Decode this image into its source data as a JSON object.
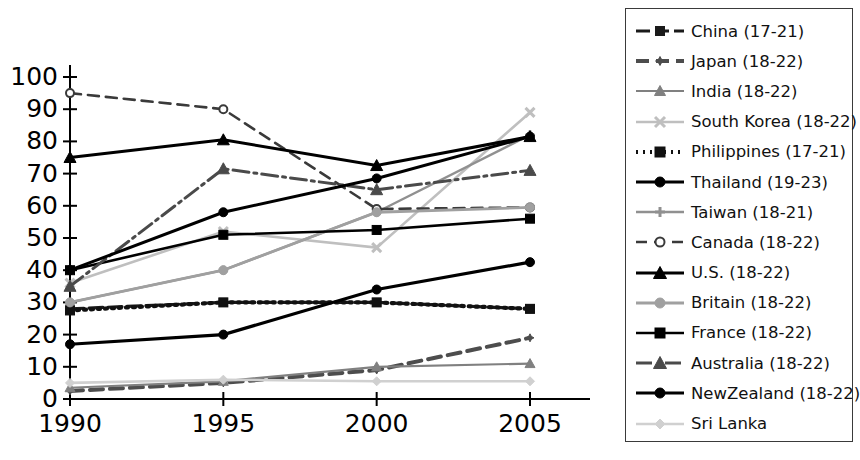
{
  "chart_data": {
    "type": "line",
    "title": "",
    "xlabel": "",
    "ylabel": "",
    "x": [
      1990,
      1995,
      2000,
      2005
    ],
    "categories": [
      "1990",
      "1995",
      "2000",
      "2005"
    ],
    "xtick_labels": [
      "1990",
      "1995",
      "2000",
      "2005"
    ],
    "ytick_labels": [
      "0",
      "10",
      "20",
      "30",
      "40",
      "50",
      "60",
      "70",
      "80",
      "90",
      "100"
    ],
    "ylim": [
      0,
      100
    ],
    "xlim": [
      1990,
      2005
    ],
    "grid": false,
    "legend_position": "right-outside",
    "series": [
      {
        "name": "China (17-21)",
        "label": "China (17-21)",
        "values": [
          28,
          30,
          30,
          28
        ],
        "color": "#1a1a1a",
        "dash": "14,5",
        "width": 3.2,
        "marker": "square",
        "marker_size": 8
      },
      {
        "name": "Japan (18-22)",
        "label": "Japan (18-22)",
        "values": [
          2.5,
          5,
          9,
          19
        ],
        "color": "#4d4d4d",
        "dash": "13,7",
        "width": 4.0,
        "marker": "star",
        "marker_size": 8
      },
      {
        "name": "India (18-22)",
        "label": "India (18-22)",
        "values": [
          3.5,
          5.5,
          10,
          11
        ],
        "color": "#808080",
        "dash": "none",
        "width": 2.2,
        "marker": "triangle",
        "marker_size": 8
      },
      {
        "name": "South Korea (18-22)",
        "label": "South Korea (18-22)",
        "values": [
          36,
          52,
          47,
          89
        ],
        "color": "#bfbfbf",
        "dash": "none",
        "width": 2.6,
        "marker": "cross",
        "marker_size": 9
      },
      {
        "name": "Philippines (17-21)",
        "label": "Philippines (17-21)",
        "values": [
          27.5,
          30,
          30,
          28
        ],
        "color": "#111111",
        "dash": "2,5",
        "width": 4.2,
        "marker": "square",
        "marker_size": 9
      },
      {
        "name": "Thailand (19-23)",
        "label": "Thailand (19-23)",
        "values": [
          17,
          20,
          34,
          42.5
        ],
        "color": "#000000",
        "dash": "none",
        "width": 3.2,
        "marker": "circle",
        "marker_size": 9
      },
      {
        "name": "Taiwan (18-21)",
        "label": "Taiwan (18-21)",
        "values": [
          30,
          40,
          58,
          82
        ],
        "color": "#909090",
        "dash": "none",
        "width": 2.4,
        "marker": "plus",
        "marker_size": 9
      },
      {
        "name": "Canada (18-22)",
        "label": "Canada (18-22)",
        "values": [
          95,
          90,
          59,
          59.5
        ],
        "color": "#3a3a3a",
        "dash": "11,7",
        "width": 2.6,
        "marker": "ocircle",
        "marker_size": 8
      },
      {
        "name": "U.S. (18-22)",
        "label": "U.S. (18-22)",
        "values": [
          75,
          80.5,
          72.5,
          81.5
        ],
        "color": "#000000",
        "dash": "none",
        "width": 3.0,
        "marker": "triangle",
        "marker_size": 10
      },
      {
        "name": "Britain (18-22)",
        "label": "Britain (18-22)",
        "values": [
          30,
          40,
          58,
          59.5
        ],
        "color": "#a0a0a0",
        "dash": "none",
        "width": 2.8,
        "marker": "circle",
        "marker_size": 9
      },
      {
        "name": "France (18-22)",
        "label": "France (18-22)",
        "values": [
          40,
          51,
          52.5,
          56
        ],
        "color": "#000000",
        "dash": "none",
        "width": 2.6,
        "marker": "square",
        "marker_size": 9
      },
      {
        "name": "Australia (18-22)",
        "label": "Australia (18-22)",
        "values": [
          35,
          71.5,
          65,
          71
        ],
        "color": "#4a4a4a",
        "dash": "16,5,3,5",
        "width": 3.0,
        "marker": "triangle",
        "marker_size": 10
      },
      {
        "name": "NewZealand (18-22)",
        "label": "NewZealand (18-22)",
        "values": [
          40,
          58,
          68.5,
          81.5
        ],
        "color": "#000000",
        "dash": "none",
        "width": 3.0,
        "marker": "circle",
        "marker_size": 9
      },
      {
        "name": "Sri Lanka",
        "label": "Sri Lanka",
        "values": [
          5,
          6,
          5.5,
          5.5
        ],
        "color": "#d0d0d0",
        "dash": "none",
        "width": 2.6,
        "marker": "diamond",
        "marker_size": 9
      }
    ]
  },
  "axis": {
    "tick_color": "#000000",
    "line_color": "#000000"
  }
}
